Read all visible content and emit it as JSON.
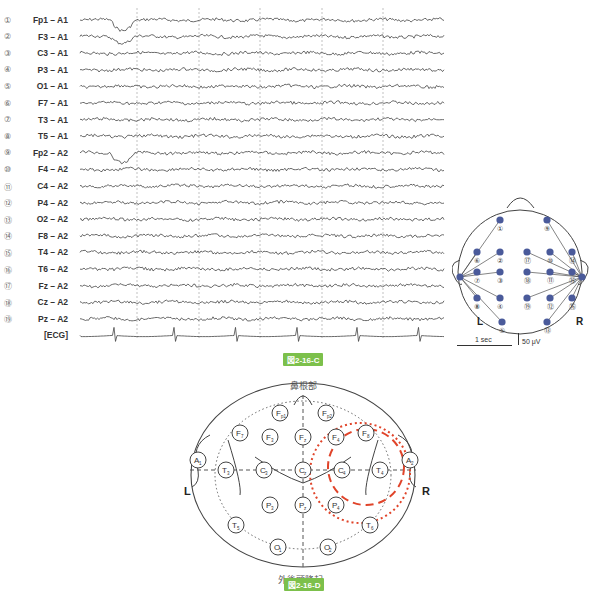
{
  "eeg_figure": {
    "caption": "図2-16-C",
    "channels": [
      {
        "num": "①",
        "name": "Fp1 – A1"
      },
      {
        "num": "②",
        "name": "F3 – A1"
      },
      {
        "num": "③",
        "name": "C3 – A1"
      },
      {
        "num": "④",
        "name": "P3 – A1"
      },
      {
        "num": "⑤",
        "name": "O1 – A1"
      },
      {
        "num": "⑥",
        "name": "F7 – A1"
      },
      {
        "num": "⑦",
        "name": "T3 – A1"
      },
      {
        "num": "⑧",
        "name": "T5 – A1"
      },
      {
        "num": "⑨",
        "name": "Fp2 – A2"
      },
      {
        "num": "⑩",
        "name": "F4 – A2"
      },
      {
        "num": "⑪",
        "name": "C4 – A2"
      },
      {
        "num": "⑫",
        "name": "P4 – A2"
      },
      {
        "num": "⑬",
        "name": "O2 – A2"
      },
      {
        "num": "⑭",
        "name": "F8 – A2"
      },
      {
        "num": "⑮",
        "name": "T4 – A2"
      },
      {
        "num": "⑯",
        "name": "T6 – A2"
      },
      {
        "num": "⑰",
        "name": "Fz – A2"
      },
      {
        "num": "⑱",
        "name": "Cz – A2"
      },
      {
        "num": "⑲",
        "name": "Pz – A2"
      },
      {
        "num": "",
        "name": "[ECG]"
      }
    ],
    "scale": {
      "time": "1 sec",
      "amplitude": "50 μV"
    },
    "montage_map": {
      "left_label": "L",
      "right_label": "R",
      "electrode_numbers": [
        "①",
        "②",
        "③",
        "④",
        "⑤",
        "⑥",
        "⑦",
        "⑧",
        "⑨",
        "⑩",
        "⑪",
        "⑫",
        "⑬",
        "⑭",
        "⑮",
        "⑯",
        "⑰",
        "⑱",
        "⑲"
      ],
      "node_color": "#4a5a9a"
    }
  },
  "placement_figure": {
    "caption": "図2-16-D",
    "top_label": "鼻根部",
    "bottom_label": "外後頭隆起",
    "left_label": "L",
    "right_label": "R",
    "electrodes": [
      "Fp1",
      "Fp2",
      "F7",
      "F3",
      "Fz",
      "F4",
      "F8",
      "A1",
      "T3",
      "C3",
      "Cz",
      "C4",
      "T4",
      "A2",
      "T5",
      "P3",
      "Pz",
      "P4",
      "T6",
      "O1",
      "O2"
    ],
    "highlight_color": "#e0442a"
  }
}
